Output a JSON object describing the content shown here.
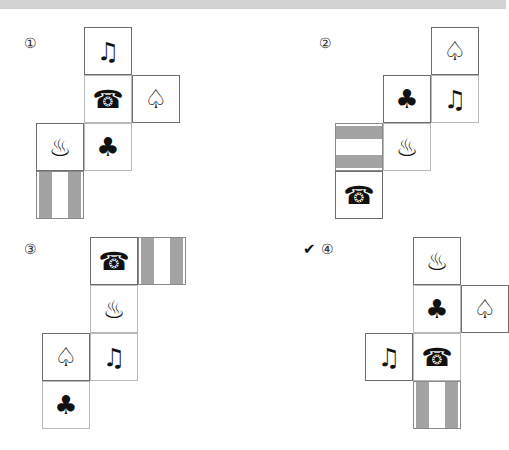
{
  "page": {
    "top_bar_color": "#d2d2d2",
    "background_color": "#ffffff",
    "cell_size_px": 48,
    "grid_line_color": "#6e6e6e",
    "bar_fill_color": "#a3a3a3"
  },
  "glyphs": {
    "note": "♫",
    "phone": "☎",
    "spade": "♤",
    "club": "♣",
    "onsen": "♨",
    "check": "✔"
  },
  "icon_names": {
    "note": "music-note-icon",
    "phone": "telephone-icon",
    "spade": "spade-outline-icon",
    "club": "club-outline-icon",
    "onsen": "hot-spring-icon",
    "bars": "striped-bars-icon"
  },
  "options": [
    {
      "id": "option-1",
      "label": "①",
      "selected": false,
      "check": "",
      "label_pos": {
        "left": 24,
        "top": 28
      },
      "net_pos": {
        "left": 36,
        "top": 18
      },
      "cells": [
        {
          "name": "face-note",
          "icon": "note",
          "col": 1,
          "row": 0,
          "seam": "solid"
        },
        {
          "name": "face-phone",
          "icon": "phone",
          "col": 1,
          "row": 1,
          "seam": "light"
        },
        {
          "name": "face-spade",
          "icon": "spade",
          "col": 2,
          "row": 1,
          "seam": "solid"
        },
        {
          "name": "face-onsen",
          "icon": "onsen",
          "col": 0,
          "row": 2,
          "seam": "solid"
        },
        {
          "name": "face-club",
          "icon": "club",
          "col": 1,
          "row": 2,
          "seam": "light"
        },
        {
          "name": "face-bars",
          "icon": "bars",
          "col": 0,
          "row": 3,
          "seam": "solid",
          "orientation": "vertical"
        }
      ]
    },
    {
      "id": "option-2",
      "label": "②",
      "selected": false,
      "check": "",
      "label_pos": {
        "left": 66,
        "top": 28
      },
      "net_pos": {
        "left": 82,
        "top": 18
      },
      "cells": [
        {
          "name": "face-spade",
          "icon": "spade",
          "col": 2,
          "row": 0,
          "seam": "solid"
        },
        {
          "name": "face-club",
          "icon": "club",
          "col": 1,
          "row": 1,
          "seam": "solid"
        },
        {
          "name": "face-note",
          "icon": "note",
          "col": 2,
          "row": 1,
          "seam": "light"
        },
        {
          "name": "face-bars",
          "icon": "bars",
          "col": 0,
          "row": 2,
          "seam": "solid",
          "orientation": "horizontal"
        },
        {
          "name": "face-onsen",
          "icon": "onsen",
          "col": 1,
          "row": 2,
          "seam": "light"
        },
        {
          "name": "face-phone",
          "icon": "phone",
          "col": 0,
          "row": 3,
          "seam": "solid"
        }
      ]
    },
    {
      "id": "option-3",
      "label": "③",
      "selected": false,
      "check": "",
      "label_pos": {
        "left": 24,
        "top": 14
      },
      "net_pos": {
        "left": 42,
        "top": 8
      },
      "cells": [
        {
          "name": "face-phone",
          "icon": "phone",
          "col": 1,
          "row": 0,
          "seam": "solid"
        },
        {
          "name": "face-bars",
          "icon": "bars",
          "col": 2,
          "row": 0,
          "seam": "solid",
          "orientation": "vertical"
        },
        {
          "name": "face-onsen",
          "icon": "onsen",
          "col": 1,
          "row": 1,
          "seam": "light"
        },
        {
          "name": "face-spade",
          "icon": "spade",
          "col": 0,
          "row": 2,
          "seam": "solid"
        },
        {
          "name": "face-note",
          "icon": "note",
          "col": 1,
          "row": 2,
          "seam": "light"
        },
        {
          "name": "face-club",
          "icon": "club",
          "col": 0,
          "row": 3,
          "seam": "light"
        }
      ]
    },
    {
      "id": "option-4",
      "label": "④",
      "selected": true,
      "check": "✔",
      "label_pos": {
        "left": 68,
        "top": 14
      },
      "check_pos": {
        "left": 50,
        "top": 13
      },
      "net_pos": {
        "left": 112,
        "top": 8
      },
      "cells": [
        {
          "name": "face-onsen",
          "icon": "onsen",
          "col": 1,
          "row": 0,
          "seam": "solid"
        },
        {
          "name": "face-club",
          "icon": "club",
          "col": 1,
          "row": 1,
          "seam": "light"
        },
        {
          "name": "face-spade",
          "icon": "spade",
          "col": 2,
          "row": 1,
          "seam": "solid"
        },
        {
          "name": "face-note",
          "icon": "note",
          "col": 0,
          "row": 2,
          "seam": "solid"
        },
        {
          "name": "face-phone",
          "icon": "phone",
          "col": 1,
          "row": 2,
          "seam": "light"
        },
        {
          "name": "face-bars",
          "icon": "bars",
          "col": 1,
          "row": 3,
          "seam": "solid",
          "orientation": "vertical"
        }
      ]
    }
  ]
}
